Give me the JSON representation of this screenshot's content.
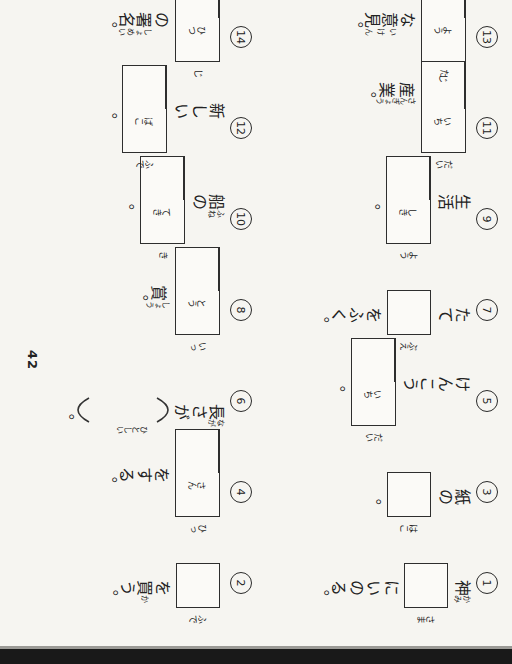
{
  "page": {
    "number": "42"
  },
  "colors": {
    "ink": "#222222",
    "paper": "#f6f5f1",
    "edge_band": "#191919"
  },
  "problems": [
    {
      "num": "1",
      "segments": [
        {
          "t": "ruby",
          "text": "神",
          "ruby": "かみ"
        },
        {
          "t": "box",
          "cells": 1,
          "furi": [
            "さま"
          ]
        },
        {
          "t": "text",
          "text": "にいのる。"
        }
      ]
    },
    {
      "num": "2",
      "segments": [
        {
          "t": "box",
          "cells": 1,
          "furi": [
            "ふで"
          ]
        },
        {
          "t": "text",
          "text": "を"
        },
        {
          "t": "ruby",
          "text": "買",
          "ruby": "か"
        },
        {
          "t": "text",
          "text": "う。"
        }
      ]
    },
    {
      "num": "3",
      "segments": [
        {
          "t": "text",
          "text": "紙の"
        },
        {
          "t": "box",
          "cells": 1,
          "furi": [
            "はこ"
          ]
        },
        {
          "t": "text",
          "text": "。"
        }
      ]
    },
    {
      "num": "4",
      "segments": [
        {
          "t": "box",
          "cells": 2,
          "furi": [
            "ひっ",
            "さん"
          ]
        },
        {
          "t": "text",
          "text": "をする。"
        }
      ]
    },
    {
      "num": "5",
      "segments": [
        {
          "t": "text",
          "text": "けんこう"
        },
        {
          "t": "box",
          "cells": 2,
          "furi": [
            "だい",
            "いち"
          ]
        },
        {
          "t": "text",
          "text": "。"
        }
      ]
    },
    {
      "num": "6",
      "segments": [
        {
          "t": "ruby",
          "text": "長",
          "ruby": "なが"
        },
        {
          "t": "text",
          "text": "さが"
        },
        {
          "t": "popen"
        },
        {
          "t": "space",
          "furi": "ひとしい"
        },
        {
          "t": "pclose"
        },
        {
          "t": "text",
          "text": "。"
        }
      ]
    },
    {
      "num": "7",
      "segments": [
        {
          "t": "text",
          "text": "たて"
        },
        {
          "t": "box",
          "cells": 1,
          "furi": [
            "ぶえ"
          ]
        },
        {
          "t": "text",
          "text": "をふく。"
        }
      ]
    },
    {
      "num": "8",
      "segments": [
        {
          "t": "box",
          "cells": 2,
          "furi": [
            "いっ",
            "とう"
          ]
        },
        {
          "t": "ruby",
          "text": "賞",
          "ruby": "しょう"
        },
        {
          "t": "text",
          "text": "。"
        }
      ]
    },
    {
      "num": "9",
      "segments": [
        {
          "t": "text",
          "text": "生活"
        },
        {
          "t": "box",
          "cells": 2,
          "furi": [
            "よう",
            "しき"
          ]
        },
        {
          "t": "text",
          "text": "。"
        }
      ]
    },
    {
      "num": "10",
      "segments": [
        {
          "t": "ruby",
          "text": "船",
          "ruby": "ふね"
        },
        {
          "t": "text",
          "text": "の"
        },
        {
          "t": "box",
          "cells": 2,
          "furi": [
            "き",
            "てき"
          ]
        },
        {
          "t": "text",
          "text": "。"
        }
      ]
    },
    {
      "num": "11",
      "segments": [
        {
          "t": "box",
          "cells": 3,
          "furi": [
            "だい",
            "いち",
            "じ"
          ]
        },
        {
          "t": "ruby",
          "text": "産業",
          "ruby": "さんぎょう"
        },
        {
          "t": "text",
          "text": "。"
        }
      ]
    },
    {
      "num": "12",
      "segments": [
        {
          "t": "text",
          "text": "新しい"
        },
        {
          "t": "box",
          "cells": 2,
          "furi": [
            "ふで",
            "ばこ"
          ]
        },
        {
          "t": "text",
          "text": "。"
        }
      ]
    },
    {
      "num": "13",
      "segments": [
        {
          "t": "box",
          "cells": 2,
          "furi": [
            "た",
            "よう"
          ]
        },
        {
          "t": "text",
          "text": "な"
        },
        {
          "t": "ruby",
          "text": "意見",
          "ruby": "いけん"
        },
        {
          "t": "text",
          "text": "。"
        }
      ]
    },
    {
      "num": "14",
      "segments": [
        {
          "t": "box",
          "cells": 2,
          "furi": [
            "じ",
            "ひつ"
          ]
        },
        {
          "t": "text",
          "text": "の"
        },
        {
          "t": "ruby",
          "text": "署名",
          "ruby": "しょめい"
        },
        {
          "t": "text",
          "text": "。"
        }
      ]
    }
  ]
}
